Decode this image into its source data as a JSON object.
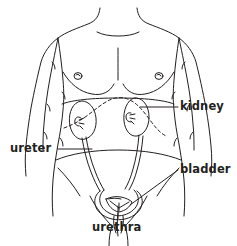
{
  "figure": {
    "background_color": "#ffffff",
    "line_color": "#231f20",
    "text_color": "#231f20"
  },
  "labels": {
    "kidney": "kidney",
    "ureter": "ureter",
    "bladder": "bladder",
    "urethra": "urethra"
  },
  "parts": [
    {
      "name": "kidney",
      "label": "kidney",
      "label_position": "right",
      "leader": "horizontal line from right kidney to text"
    },
    {
      "name": "ureter",
      "label": "ureter",
      "label_position": "left",
      "leader": "horizontal line from text to left ureter tube"
    },
    {
      "name": "bladder",
      "label": "bladder",
      "label_position": "right",
      "leader": "diagonal line from bladder up-right to text"
    },
    {
      "name": "urethra",
      "label": "urethra",
      "label_position": "below",
      "leader": "short vertical line from urethra down to text"
    }
  ],
  "icons": {
    "body_outline": "torso-outline",
    "kidney_left": "kidney-left-shape",
    "kidney_right": "kidney-right-shape",
    "ureter_left": "ureter-left-tube",
    "ureter_right": "ureter-right-tube",
    "bladder": "bladder-shape",
    "urethra": "urethra-tube",
    "ribcage": "ribcage-dashed-line"
  }
}
